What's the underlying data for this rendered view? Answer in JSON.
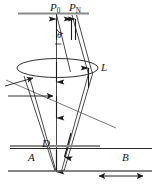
{
  "figure": {
    "type": "optical-ray-diagram",
    "width": 156,
    "height": 193,
    "background": "#ffffff",
    "line_color": "#1a1a1a",
    "gray_line_color": "#8a8a8a",
    "labels": {
      "p0": "P",
      "p0_sub": "0",
      "pn": "P",
      "pn_sub": "N",
      "theta": "θ",
      "lens": "L",
      "aperture": "D",
      "region_a": "A",
      "region_b": "B"
    },
    "caption": "",
    "elements": {
      "source_plane_label": "source-plane",
      "lens_label": "lens-ellipse",
      "detector_plane_label": "detector-plane",
      "aperture_plane_label": "aperture-plane",
      "scale_bar_label": "scale-bar"
    }
  }
}
